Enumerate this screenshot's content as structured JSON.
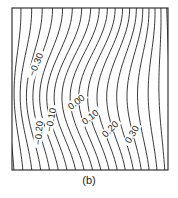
{
  "chart_data": {
    "type": "contour",
    "title": "",
    "caption": "(b)",
    "xlabel": "",
    "ylabel": "",
    "grid": false,
    "legend": null,
    "contour_levels": [
      -0.3,
      -0.2,
      -0.1,
      0.0,
      0.1,
      0.2,
      0.3
    ],
    "contour_labels": [
      {
        "text": "-0.30",
        "x": 37,
        "y": 65,
        "angle": -68
      },
      {
        "text": "-0.20",
        "x": 40,
        "y": 133,
        "angle": -85
      },
      {
        "text": "-0.10",
        "x": 52,
        "y": 120,
        "angle": -80
      },
      {
        "text": "0.00",
        "x": 77,
        "y": 103,
        "angle": -38
      },
      {
        "text": "0.10",
        "x": 91,
        "y": 118,
        "angle": -38
      },
      {
        "text": "0.20",
        "x": 111,
        "y": 130,
        "angle": -45
      },
      {
        "text": "0.30",
        "x": 133,
        "y": 135,
        "angle": -60
      }
    ],
    "line_count": 22,
    "line_color": "#222222",
    "frame": {
      "x": 12,
      "y": 8,
      "width": 156,
      "height": 162
    }
  },
  "caption": "(b)"
}
